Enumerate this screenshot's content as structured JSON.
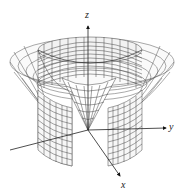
{
  "figure": {
    "axes": {
      "x_label": "x",
      "y_label": "y",
      "z_label": "z"
    },
    "surfaces": [
      "cylinder",
      "cone",
      "flared-surface"
    ],
    "colors": {
      "line": "#333333",
      "mesh": "#555555",
      "background": "#ffffff"
    }
  }
}
